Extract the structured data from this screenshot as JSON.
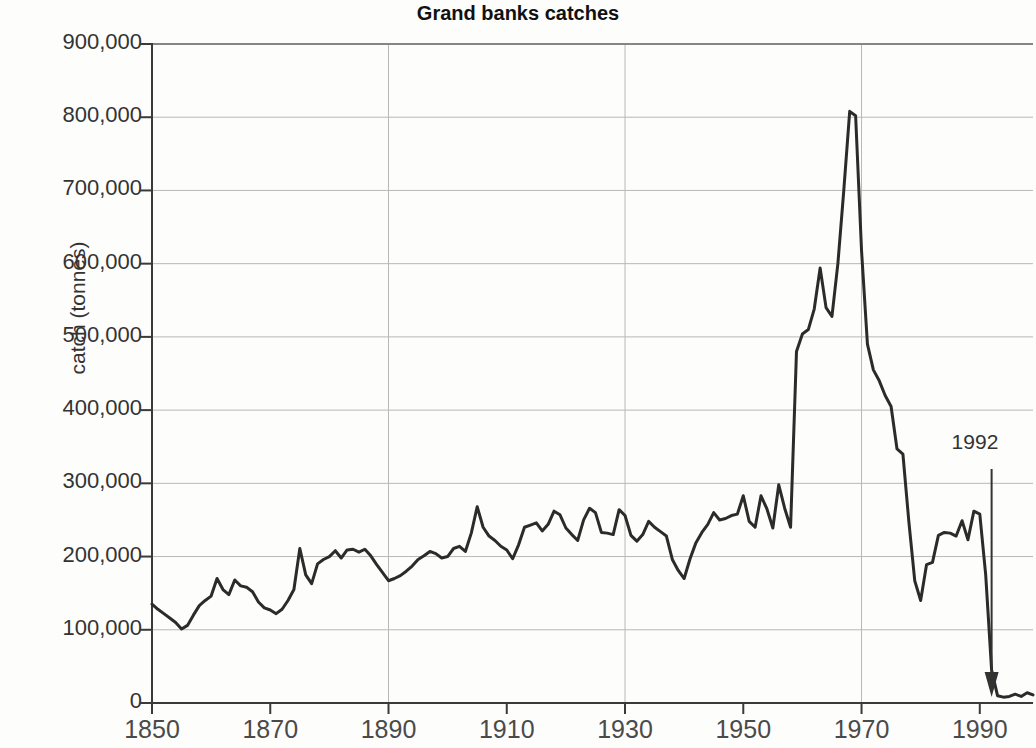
{
  "chart_data": {
    "type": "line",
    "title": "Grand banks catches",
    "xlabel": "",
    "ylabel": "catch (tonnes)",
    "xlim": [
      1850,
      1999
    ],
    "ylim": [
      0,
      900000
    ],
    "grid": true,
    "legend": null,
    "xticks": [
      "1850",
      "1870",
      "1890",
      "1910",
      "1930",
      "1950",
      "1970",
      "1990"
    ],
    "xtick_values": [
      1850,
      1870,
      1890,
      1910,
      1930,
      1950,
      1970,
      1990
    ],
    "yticks": [
      "0",
      "100,000",
      "200,000",
      "300,000",
      "400,000",
      "500,000",
      "600,000",
      "700,000",
      "800,000",
      "900,000"
    ],
    "ytick_values": [
      0,
      100000,
      200000,
      300000,
      400000,
      500000,
      600000,
      700000,
      800000,
      900000
    ],
    "annotations": [
      {
        "label": "1992",
        "x": 1992,
        "y": 0,
        "type": "arrow-down"
      }
    ],
    "series": [
      {
        "name": "Grand banks catches",
        "color": "#2b2b2b",
        "x": [
          1850,
          1851,
          1852,
          1853,
          1854,
          1855,
          1856,
          1857,
          1858,
          1859,
          1860,
          1861,
          1862,
          1863,
          1864,
          1865,
          1866,
          1867,
          1868,
          1869,
          1870,
          1871,
          1872,
          1873,
          1874,
          1875,
          1876,
          1877,
          1878,
          1879,
          1880,
          1881,
          1882,
          1883,
          1884,
          1885,
          1886,
          1887,
          1888,
          1889,
          1890,
          1891,
          1892,
          1893,
          1894,
          1895,
          1896,
          1897,
          1898,
          1899,
          1900,
          1901,
          1902,
          1903,
          1904,
          1905,
          1906,
          1907,
          1908,
          1909,
          1910,
          1911,
          1912,
          1913,
          1914,
          1915,
          1916,
          1917,
          1918,
          1919,
          1920,
          1921,
          1922,
          1923,
          1924,
          1925,
          1926,
          1927,
          1928,
          1929,
          1930,
          1931,
          1932,
          1933,
          1934,
          1935,
          1936,
          1937,
          1938,
          1939,
          1940,
          1941,
          1942,
          1943,
          1944,
          1945,
          1946,
          1947,
          1948,
          1949,
          1950,
          1951,
          1952,
          1953,
          1954,
          1955,
          1956,
          1957,
          1958,
          1959,
          1960,
          1961,
          1962,
          1963,
          1964,
          1965,
          1966,
          1967,
          1968,
          1969,
          1970,
          1971,
          1972,
          1973,
          1974,
          1975,
          1976,
          1977,
          1978,
          1979,
          1980,
          1981,
          1982,
          1983,
          1984,
          1985,
          1986,
          1987,
          1988,
          1989,
          1990,
          1991,
          1992,
          1993,
          1994,
          1995,
          1996,
          1997,
          1998,
          1999
        ],
        "y": [
          135000,
          128000,
          122000,
          116000,
          110000,
          101000,
          106000,
          120000,
          133000,
          140000,
          146000,
          170000,
          155000,
          148000,
          168000,
          160000,
          158000,
          152000,
          138000,
          130000,
          127000,
          122000,
          128000,
          140000,
          155000,
          211000,
          175000,
          163000,
          190000,
          196000,
          200000,
          208000,
          198000,
          209000,
          210000,
          206000,
          210000,
          201000,
          189000,
          178000,
          167000,
          170000,
          174000,
          180000,
          187000,
          196000,
          201000,
          207000,
          204000,
          198000,
          200000,
          211000,
          214000,
          207000,
          232000,
          268000,
          240000,
          228000,
          222000,
          214000,
          209000,
          197000,
          216000,
          240000,
          243000,
          246000,
          235000,
          244000,
          262000,
          257000,
          239000,
          230000,
          222000,
          250000,
          266000,
          260000,
          233000,
          232000,
          230000,
          264000,
          256000,
          229000,
          221000,
          230000,
          248000,
          240000,
          234000,
          228000,
          196000,
          181000,
          170000,
          197000,
          219000,
          233000,
          244000,
          260000,
          250000,
          252000,
          256000,
          258000,
          283000,
          248000,
          240000,
          283000,
          265000,
          239000,
          298000,
          266000,
          240000,
          480000,
          504000,
          510000,
          538000,
          594000,
          540000,
          528000,
          600000,
          700000,
          808000,
          802000,
          618000,
          490000,
          455000,
          440000,
          420000,
          405000,
          347000,
          340000,
          248000,
          167000,
          140000,
          189000,
          192000,
          229000,
          233000,
          232000,
          228000,
          249000,
          223000,
          262000,
          258000,
          175000,
          45000,
          10000,
          8000,
          9000,
          12000,
          9000,
          14000,
          11000
        ]
      }
    ]
  },
  "axis": {
    "title": "Grand banks catches",
    "y_label": "catch (tonnes)"
  },
  "annotation": {
    "year_label": "1992"
  },
  "colors": {
    "line": "#2b2b2b",
    "grid": "#b8b8b8",
    "axis": "#3a3a3a",
    "background": "#fdfdfc",
    "text": "#333333"
  }
}
